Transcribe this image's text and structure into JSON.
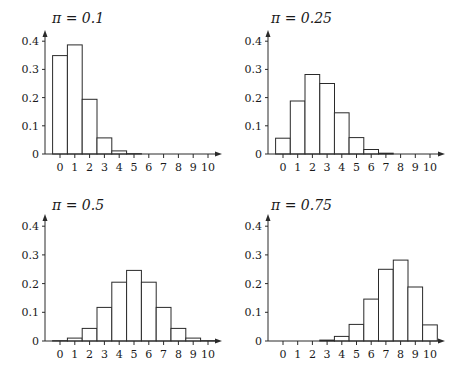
{
  "chart_data": [
    {
      "type": "bar",
      "title": "π = 0.1",
      "xlabel": "",
      "ylabel": "",
      "categories": [
        "0",
        "1",
        "2",
        "3",
        "4",
        "5",
        "6",
        "7",
        "8",
        "9",
        "10"
      ],
      "values": [
        0.349,
        0.387,
        0.194,
        0.057,
        0.011,
        0.001,
        0.0,
        0.0,
        0.0,
        0.0,
        0.0
      ],
      "yticks": [
        "0",
        "0.1",
        "0.2",
        "0.3",
        "0.4"
      ],
      "ylim": [
        0,
        0.4
      ],
      "grid": false,
      "legend": null
    },
    {
      "type": "bar",
      "title": "π = 0.25",
      "xlabel": "",
      "ylabel": "",
      "categories": [
        "0",
        "1",
        "2",
        "3",
        "4",
        "5",
        "6",
        "7",
        "8",
        "9",
        "10"
      ],
      "values": [
        0.056,
        0.188,
        0.282,
        0.25,
        0.146,
        0.058,
        0.016,
        0.003,
        0.0,
        0.0,
        0.0
      ],
      "yticks": [
        "0",
        "0.1",
        "0.2",
        "0.3",
        "0.4"
      ],
      "ylim": [
        0,
        0.4
      ],
      "grid": false,
      "legend": null
    },
    {
      "type": "bar",
      "title": "π = 0.5",
      "xlabel": "",
      "ylabel": "",
      "categories": [
        "0",
        "1",
        "2",
        "3",
        "4",
        "5",
        "6",
        "7",
        "8",
        "9",
        "10"
      ],
      "values": [
        0.001,
        0.01,
        0.044,
        0.117,
        0.205,
        0.246,
        0.205,
        0.117,
        0.044,
        0.01,
        0.001
      ],
      "yticks": [
        "0",
        "0.1",
        "0.2",
        "0.3",
        "0.4"
      ],
      "ylim": [
        0,
        0.4
      ],
      "grid": false,
      "legend": null
    },
    {
      "type": "bar",
      "title": "π = 0.75",
      "xlabel": "",
      "ylabel": "",
      "categories": [
        "0",
        "1",
        "2",
        "3",
        "4",
        "5",
        "6",
        "7",
        "8",
        "9",
        "10"
      ],
      "values": [
        0.0,
        0.0,
        0.0,
        0.003,
        0.016,
        0.058,
        0.146,
        0.25,
        0.282,
        0.188,
        0.056
      ],
      "yticks": [
        "0",
        "0.1",
        "0.2",
        "0.3",
        "0.4"
      ],
      "ylim": [
        0,
        0.4
      ],
      "grid": false,
      "legend": null
    }
  ],
  "panels": [
    {
      "title": "π = 0.1"
    },
    {
      "title": "π = 0.25"
    },
    {
      "title": "π = 0.5"
    },
    {
      "title": "π = 0.75"
    }
  ],
  "colors": {
    "bar_fill": "#ffffff",
    "bar_stroke": "#2a2a2a",
    "axis": "#2a2a2a",
    "text": "#1a1a1a"
  }
}
